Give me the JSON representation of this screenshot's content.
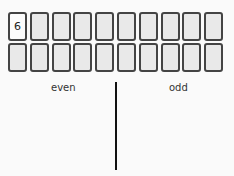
{
  "board": {
    "rows": [
      [
        {
          "value": "6",
          "face_up": true
        },
        {
          "value": "",
          "face_up": false
        },
        {
          "value": "",
          "face_up": false
        },
        {
          "value": "",
          "face_up": false
        },
        {
          "value": "",
          "face_up": false
        },
        {
          "value": "",
          "face_up": false
        },
        {
          "value": "",
          "face_up": false
        },
        {
          "value": "",
          "face_up": false
        },
        {
          "value": "",
          "face_up": false
        },
        {
          "value": "",
          "face_up": false
        }
      ],
      [
        {
          "value": "",
          "face_up": false
        },
        {
          "value": "",
          "face_up": false
        },
        {
          "value": "",
          "face_up": false
        },
        {
          "value": "",
          "face_up": false
        },
        {
          "value": "",
          "face_up": false
        },
        {
          "value": "",
          "face_up": false
        },
        {
          "value": "",
          "face_up": false
        },
        {
          "value": "",
          "face_up": false
        },
        {
          "value": "",
          "face_up": false
        },
        {
          "value": "",
          "face_up": false
        }
      ]
    ]
  },
  "sort_zones": {
    "left_label": "even",
    "right_label": "odd"
  }
}
